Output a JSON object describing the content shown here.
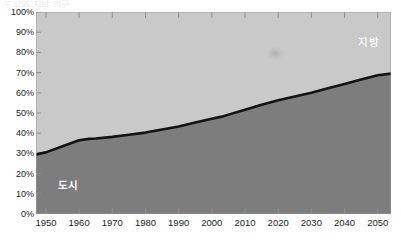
{
  "page": {
    "top_remnant_text": "도시와 지방 인구"
  },
  "chart_data": {
    "type": "area",
    "title": "",
    "subtitle": "",
    "xlabel": "",
    "ylabel": "",
    "stacked": true,
    "stack_total": 100,
    "grid": false,
    "legend_position": "inside-plot",
    "xlim": [
      1947,
      2054
    ],
    "ylim": [
      0,
      100
    ],
    "x_tick_labels": [
      "1950",
      "1960",
      "1970",
      "1980",
      "1990",
      "2000",
      "2010",
      "2020",
      "2030",
      "2040",
      "2050"
    ],
    "x_ticks": [
      1950,
      1960,
      1970,
      1980,
      1990,
      2000,
      2010,
      2020,
      2030,
      2040,
      2050
    ],
    "y_tick_labels": [
      "100%",
      "90%",
      "80%",
      "70%",
      "60%",
      "50%",
      "40%",
      "30%",
      "20%",
      "10%",
      "0%"
    ],
    "y_ticks": [
      100,
      90,
      80,
      70,
      60,
      50,
      40,
      30,
      20,
      10,
      0
    ],
    "x": [
      1947,
      1950,
      1955,
      1960,
      1963,
      1965,
      1970,
      1975,
      1980,
      1985,
      1990,
      1995,
      2000,
      2003,
      2005,
      2010,
      2015,
      2020,
      2025,
      2030,
      2035,
      2040,
      2045,
      2050,
      2054
    ],
    "series": [
      {
        "name": "도시",
        "label": "도시",
        "color": "#7d7d7d",
        "position": "bottom",
        "values": [
          29.5,
          30.5,
          33.5,
          36.5,
          37.2,
          37.4,
          38.2,
          39.2,
          40.3,
          41.8,
          43.3,
          45.3,
          47.2,
          48.2,
          49.2,
          51.6,
          54.1,
          56.3,
          58.2,
          60.0,
          62.2,
          64.4,
          66.6,
          68.7,
          69.5
        ]
      },
      {
        "name": "지방",
        "label": "지방",
        "color": "#c9c9c9",
        "position": "top",
        "values": [
          70.5,
          69.5,
          66.5,
          63.5,
          62.8,
          62.6,
          61.8,
          60.8,
          59.7,
          58.2,
          56.7,
          54.7,
          52.8,
          51.8,
          50.8,
          48.4,
          45.9,
          43.7,
          41.8,
          40.0,
          37.8,
          35.6,
          33.4,
          31.3,
          30.5
        ]
      }
    ],
    "divider_line": {
      "color": "#131313",
      "width": 2.6,
      "description": "thick black boundary between 도시 and 지방"
    },
    "annotations": [
      {
        "text": "지방",
        "position": "upper-right",
        "color": "#ffffff"
      },
      {
        "text": "도시",
        "position": "lower-left",
        "color": "#ffffff"
      }
    ]
  }
}
